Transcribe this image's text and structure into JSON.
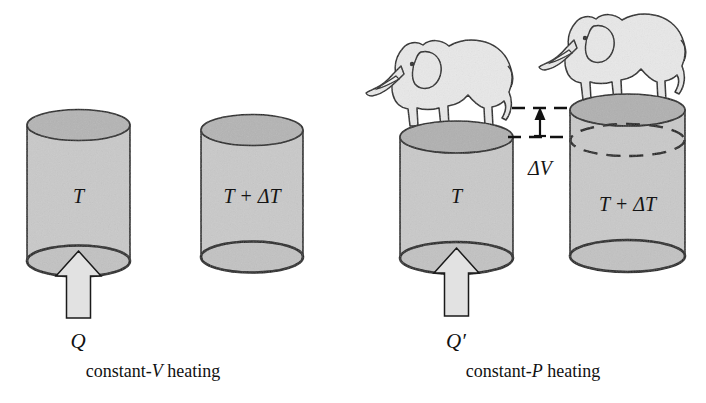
{
  "figure": {
    "name": "constant-volume vs constant-pressure heating",
    "background_color": "#ffffff",
    "width": 706,
    "height": 403
  },
  "colors": {
    "outline": "#1a1a1a",
    "cylinder_body_fill": "#c9c9c9",
    "cylinder_top_fill": "#b4b4b4",
    "cylinder_bottom_fill": "#c2c2c2",
    "arrow_fill": "#e2e2e2",
    "elephant_fill": "#e8e8e8",
    "dashed_stroke": "#111111"
  },
  "panels": [
    {
      "id": "constant-volume",
      "caption_symbol": "Q",
      "caption_text_prefix": "constant-",
      "caption_text_variable": "V",
      "caption_text_suffix": " heating",
      "caption_full": "constant-V heating",
      "heat_arrow": true,
      "has_elephants": false,
      "cylinders": [
        {
          "id": "cv-before",
          "temperature_label": "T",
          "state": "before"
        },
        {
          "id": "cv-after",
          "temperature_label": "T + ΔT",
          "state": "after"
        }
      ]
    },
    {
      "id": "constant-pressure",
      "caption_symbol": "Q′",
      "caption_text_prefix": "constant-",
      "caption_text_variable": "P",
      "caption_text_suffix": " heating",
      "caption_full": "constant-P heating",
      "heat_arrow": true,
      "has_elephants": true,
      "cylinders": [
        {
          "id": "cp-before",
          "temperature_label": "T",
          "state": "before"
        },
        {
          "id": "cp-after",
          "temperature_label": "T + ΔT",
          "state": "after"
        }
      ],
      "volume_change": {
        "label": "ΔV",
        "arrow_direction": "up",
        "reference_lines": 2,
        "dashed": true
      }
    }
  ],
  "annotations": {
    "delta_v_label": "ΔV",
    "temp_before": "T",
    "temp_after": "T + ΔT"
  }
}
